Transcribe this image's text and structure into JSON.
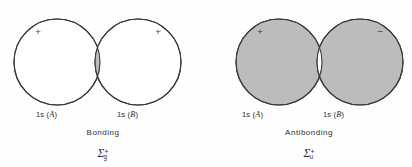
{
  "figure": {
    "background_color": "#fefefe",
    "outline_color": "#3a3a3a",
    "shade_color": "#bcbcbc",
    "white_color": "#ffffff"
  },
  "panels": [
    {
      "id": "bonding",
      "type_label": "Bonding",
      "term_symbol": {
        "symbol": "Σ",
        "subscript": "g",
        "superscript": "+"
      },
      "lobes": [
        {
          "orbital_label": "1s (",
          "atom": "A",
          "orbital_label_close": ")",
          "sign": "+",
          "fill": "white"
        },
        {
          "orbital_label": "1s (",
          "atom": "B",
          "orbital_label_close": ")",
          "sign": "+",
          "fill": "white"
        }
      ],
      "overlap_fill": "gray",
      "overlap_description": "lens-shaped overlap region shaded gray (constructive, in-phase)"
    },
    {
      "id": "antibonding",
      "type_label": "Antibonding",
      "term_symbol": {
        "symbol": "Σ",
        "subscript": "u",
        "superscript": "+"
      },
      "lobes": [
        {
          "orbital_label": "1s (",
          "atom": "A",
          "orbital_label_close": ")",
          "sign": "+",
          "fill": "gray"
        },
        {
          "orbital_label": "1s (",
          "atom": "B",
          "orbital_label_close": ")",
          "sign": "−",
          "fill": "gray"
        }
      ],
      "overlap_fill": "white",
      "overlap_description": "lens-shaped overlap region left white (destructive, out-of-phase)"
    }
  ]
}
